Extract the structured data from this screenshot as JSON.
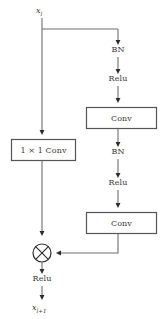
{
  "diagram": {
    "title": "Residual block with 1x1 convolution shortcut",
    "type": "flow-diagram",
    "colors": {
      "line": "#6e6e6e",
      "arrow": "#2b2b2b",
      "box_border": "#555555",
      "text": "#3a3a3a",
      "background": "#ffffff"
    },
    "input": {
      "label": "x",
      "subscript": "l"
    },
    "output": {
      "label": "x",
      "subscript": "l+1"
    },
    "main_path": [
      {
        "name": "bn-1",
        "label": "BN",
        "shape": "text"
      },
      {
        "name": "relu-1",
        "label": "Relu",
        "shape": "text"
      },
      {
        "name": "conv-1",
        "label": "Conv",
        "shape": "box"
      },
      {
        "name": "bn-2",
        "label": "BN",
        "shape": "text"
      },
      {
        "name": "relu-2",
        "label": "Relu",
        "shape": "text"
      },
      {
        "name": "conv-2",
        "label": "Conv",
        "shape": "box"
      }
    ],
    "shortcut_path": [
      {
        "name": "one-by-one-conv",
        "label": "1 × 1 Conv",
        "shape": "box"
      }
    ],
    "merge": {
      "name": "multiply-merge",
      "symbol": "⊗",
      "operation": "elementwise-merge"
    },
    "post_merge": [
      {
        "name": "relu-3",
        "label": "Relu",
        "shape": "text"
      }
    ]
  }
}
